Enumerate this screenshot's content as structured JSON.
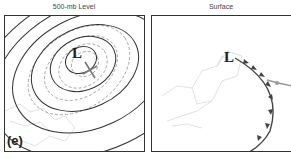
{
  "panels": [
    {
      "title": "500-mb Level",
      "low_label": "L",
      "panel_label": "(e)"
    },
    {
      "title": "Surface",
      "low_label": "L"
    }
  ],
  "colors": {
    "contour": "#333333",
    "dashed": "#999999",
    "map": "#cccccc",
    "front": "#444444"
  }
}
